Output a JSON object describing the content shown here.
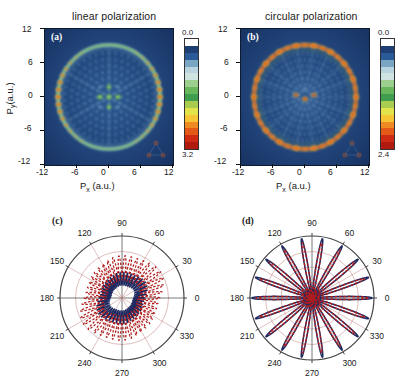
{
  "figure": {
    "panels": [
      {
        "id": "a",
        "tag": "(a)",
        "title": "linear polarization",
        "type": "momentum-map",
        "xlabel": "P",
        "xlabel_sub": "x",
        "xlabel_unit": " (a.u.)",
        "ylabel": "P",
        "ylabel_sub": "y",
        "ylabel_unit": "(a.u.)",
        "xticks": [
          "-12",
          "-6",
          "0",
          "6",
          "12"
        ],
        "yticks": [
          "12",
          "6",
          "0",
          "-6",
          "-12"
        ],
        "xlim": [
          -12,
          12
        ],
        "ylim": [
          -12,
          12
        ],
        "colorbar": {
          "min": "0.0",
          "max": "3.2"
        }
      },
      {
        "id": "b",
        "tag": "(b)",
        "title": "circular polarization",
        "type": "momentum-map",
        "xlabel": "P",
        "xlabel_sub": "x",
        "xlabel_unit": " (a.u.)",
        "xticks": [
          "-12",
          "-6",
          "0",
          "6",
          "12"
        ],
        "yticks": [
          "12",
          "6",
          "0",
          "-6",
          "-12"
        ],
        "xlim": [
          -12,
          12
        ],
        "ylim": [
          -12,
          12
        ],
        "colorbar": {
          "min": "0.0",
          "max": "2.4"
        }
      },
      {
        "id": "c",
        "tag": "(c)",
        "type": "polar",
        "angleticks": [
          "0",
          "30",
          "60",
          "90",
          "120",
          "150",
          "180",
          "210",
          "240",
          "270",
          "300",
          "330"
        ]
      },
      {
        "id": "d",
        "tag": "(d)",
        "type": "polar",
        "angleticks": [
          "0",
          "30",
          "60",
          "90",
          "120",
          "150",
          "180",
          "210",
          "240",
          "270",
          "300",
          "330"
        ]
      }
    ]
  },
  "colors": {
    "map_background": "#1b3a6b",
    "ring_hot": "#c8271c",
    "ring_warm": "#f0a020",
    "ring_green": "#7ec06a",
    "ring_cyan": "#bcd8e4",
    "curve_red": "#b01c1c",
    "curve_blue": "#1f2a60",
    "polar_grid": "#c98f8f",
    "polar_frame": "#444444",
    "axis": "#111111"
  },
  "colorbar_stops": [
    "#ffffff",
    "#1d3f73",
    "#2a5a97",
    "#7aa6c4",
    "#b9d4df",
    "#cfe3e0",
    "#9ccf8e",
    "#69b75c",
    "#3f9e4d",
    "#a8cc4e",
    "#e2e24a",
    "#f6c534",
    "#ef8a22",
    "#e35a18",
    "#cf2a14",
    "#b01a10"
  ],
  "chart_data": {
    "type": "heatmap",
    "panels": [
      {
        "id": "a",
        "type": "heatmap",
        "title": "linear polarization",
        "xlabel": "P_x (a.u.)",
        "ylabel": "P_y (a.u.)",
        "xlim": [
          -12,
          12
        ],
        "ylim": [
          -12,
          12
        ],
        "xticks": [
          -12,
          -6,
          0,
          6,
          12
        ],
        "yticks": [
          -12,
          -6,
          0,
          6,
          12
        ],
        "zlim": [
          0.0,
          3.2
        ],
        "description": "Circular ATI ring of radius ~9.3 a.u. with hexagonally ordered interference maxima inside; strongest (red) hot-spots on the ring at the left and right sides along the polarization axis",
        "ring_radius": 9.3,
        "hotspot_angles_deg": [
          0,
          180
        ],
        "inner_lattice_symmetry": 6
      },
      {
        "id": "b",
        "type": "heatmap",
        "title": "circular polarization",
        "xlabel": "P_x (a.u.)",
        "ylabel": "P_y (a.u.)",
        "xlim": [
          -12,
          12
        ],
        "ylim": [
          -12,
          12
        ],
        "xticks": [
          -12,
          -6,
          0,
          6,
          12
        ],
        "yticks": [
          -12,
          -6,
          0,
          6,
          12
        ],
        "zlim": [
          0.0,
          2.4
        ],
        "description": "Nearly uniform bright ATI ring of radius ~9.3 a.u. modulated into many hot-spots around the full azimuth, with radial spoke-like interference inside",
        "ring_radius": 9.3,
        "ring_modulation_lobes": 18
      },
      {
        "id": "c",
        "type": "line",
        "projection": "polar",
        "angle_unit": "degree",
        "angleticks": [
          0,
          30,
          60,
          90,
          120,
          150,
          180,
          210,
          240,
          270,
          300,
          330
        ],
        "rgrid": [
          0.25,
          0.5,
          0.75,
          1.0
        ],
        "rlim": [
          0,
          1
        ],
        "series": [
          {
            "name": "red-dashed",
            "style": "dashed",
            "color": "#b01c1c",
            "description": "Strongly spiked angular distribution, many narrow peaks across all angles, largest lobes near 30 and 90 degrees"
          },
          {
            "name": "blue-solid",
            "style": "solid",
            "color": "#1f2a60",
            "description": "Smoother underlying envelope with lobes at similar angles but lower amplitude"
          }
        ]
      },
      {
        "id": "d",
        "type": "line",
        "projection": "polar",
        "angle_unit": "degree",
        "angleticks": [
          0,
          30,
          60,
          90,
          120,
          150,
          180,
          210,
          240,
          270,
          300,
          330
        ],
        "rgrid": [
          0.25,
          0.5,
          0.75,
          1.0
        ],
        "rlim": [
          0,
          1
        ],
        "series": [
          {
            "name": "red-dashed",
            "style": "dashed",
            "color": "#b01c1c",
            "n_lobes": 18,
            "description": "Clean 18-lobed rosette, lobes evenly spaced every 20 degrees"
          },
          {
            "name": "blue-solid",
            "style": "solid",
            "color": "#1f2a60",
            "n_lobes": 18,
            "description": "Overlapping 18-lobed rosette tracing the same petals"
          }
        ]
      }
    ]
  }
}
